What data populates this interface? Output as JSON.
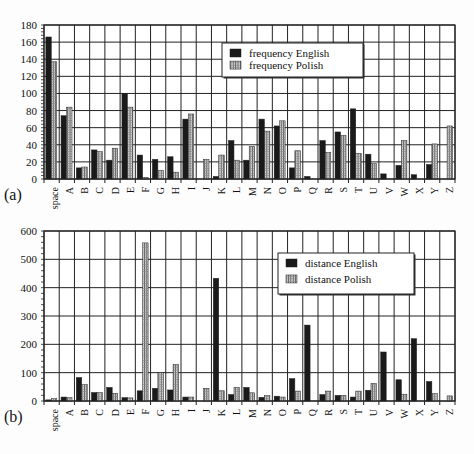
{
  "figure": {
    "panel_labels": [
      "(a)",
      "(b)"
    ],
    "caption_partial": "Fig. ... (caption cut off)"
  },
  "colors": {
    "english": "#1a1a1a",
    "polish_fill": "#cfcfcf",
    "polish_stripe": "#555555",
    "grid": "#222222",
    "background": "#fdfdfd"
  },
  "chart_data": [
    {
      "id": "a",
      "type": "bar",
      "title": "",
      "xlabel": "",
      "ylabel": "",
      "categories": [
        "space",
        "A",
        "B",
        "C",
        "D",
        "E",
        "F",
        "G",
        "H",
        "I",
        "J",
        "K",
        "L",
        "M",
        "N",
        "O",
        "P",
        "Q",
        "R",
        "S",
        "T",
        "U",
        "V",
        "W",
        "X",
        "Y",
        "Z"
      ],
      "series": [
        {
          "name": "frequency English",
          "values": [
            166,
            74,
            13,
            34,
            22,
            100,
            28,
            23,
            26,
            70,
            0,
            3,
            45,
            22,
            70,
            62,
            13,
            3,
            45,
            55,
            82,
            29,
            6,
            16,
            5,
            17,
            0
          ]
        },
        {
          "name": "frequency Polish",
          "values": [
            137,
            84,
            14,
            32,
            36,
            84,
            2,
            10,
            8,
            76,
            23,
            28,
            22,
            38,
            56,
            68,
            33,
            0,
            31,
            51,
            30,
            18,
            0,
            45,
            0,
            41,
            62
          ]
        }
      ],
      "ylim": [
        0,
        180
      ],
      "yticks": [
        0,
        20,
        40,
        60,
        80,
        100,
        120,
        140,
        160,
        180
      ],
      "grid": true,
      "legend_position": "upper-center"
    },
    {
      "id": "b",
      "type": "bar",
      "title": "",
      "xlabel": "",
      "ylabel": "",
      "categories": [
        "space",
        "A",
        "B",
        "C",
        "D",
        "E",
        "F",
        "G",
        "H",
        "I",
        "J",
        "K",
        "L",
        "M",
        "N",
        "O",
        "P",
        "Q",
        "R",
        "S",
        "T",
        "U",
        "V",
        "W",
        "X",
        "Y",
        "Z"
      ],
      "series": [
        {
          "name": "distance English",
          "values": [
            4,
            14,
            83,
            30,
            48,
            12,
            36,
            45,
            39,
            14,
            0,
            433,
            23,
            48,
            13,
            17,
            79,
            268,
            23,
            20,
            14,
            38,
            173,
            75,
            220,
            69,
            0
          ]
        },
        {
          "name": "distance Polish",
          "values": [
            8,
            12,
            58,
            30,
            27,
            11,
            558,
            100,
            129,
            14,
            45,
            36,
            48,
            29,
            19,
            14,
            35,
            0,
            35,
            20,
            35,
            62,
            0,
            24,
            0,
            26,
            18
          ]
        }
      ],
      "ylim": [
        0,
        600
      ],
      "yticks": [
        0,
        100,
        200,
        300,
        400,
        500,
        600
      ],
      "grid": true,
      "legend_position": "upper-right-center"
    }
  ]
}
